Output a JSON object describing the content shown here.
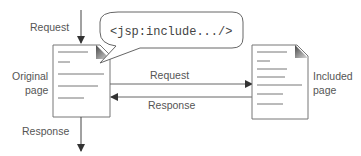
{
  "diagram": {
    "labels": {
      "request_in": "Request",
      "response_out": "Response",
      "original_line1": "Original",
      "original_line2": "page",
      "included_line1": "Included",
      "included_line2": "page",
      "middle_request": "Request",
      "middle_response": "Response"
    },
    "callout": "<jsp:include.../>",
    "colors": {
      "stroke": "#666666",
      "text": "#555555",
      "fold": "#888888"
    }
  }
}
